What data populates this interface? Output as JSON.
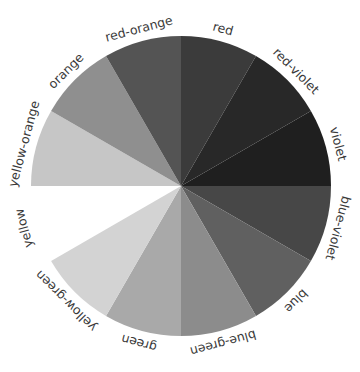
{
  "diagram": {
    "type": "color-wheel",
    "center": [
      181,
      186
    ],
    "radius": 150,
    "label_radius": 162,
    "slices": [
      {
        "name": "violet",
        "label": "violet",
        "start": -30,
        "end": 0,
        "color": "#1f1f1f",
        "present": true
      },
      {
        "name": "blue-violet",
        "label": "blue-violet",
        "start": 0,
        "end": 30,
        "color": "#474747",
        "present": true
      },
      {
        "name": "blue",
        "label": "blue",
        "start": 30,
        "end": 60,
        "color": "#606060",
        "present": true
      },
      {
        "name": "blue-green",
        "label": "blue-green",
        "start": 60,
        "end": 90,
        "color": "#8c8c8c",
        "present": true
      },
      {
        "name": "green",
        "label": "green",
        "start": 90,
        "end": 120,
        "color": "#a9a9a9",
        "present": true
      },
      {
        "name": "yellow-green",
        "label": "yellow-green",
        "start": 120,
        "end": 150,
        "color": "#d3d3d3",
        "present": true
      },
      {
        "name": "yellow",
        "label": "yellow",
        "start": 150,
        "end": 180,
        "color": "#ffffff",
        "present": false
      },
      {
        "name": "yellow-orange",
        "label": "yellow-orange",
        "start": 180,
        "end": 210,
        "color": "#c6c6c6",
        "present": true
      },
      {
        "name": "orange",
        "label": "orange",
        "start": 210,
        "end": 240,
        "color": "#8f8f8f",
        "present": true
      },
      {
        "name": "red-orange",
        "label": "red-orange",
        "start": 240,
        "end": 270,
        "color": "#545454",
        "present": true
      },
      {
        "name": "red",
        "label": "red",
        "start": 270,
        "end": 300,
        "color": "#3b3b3b",
        "present": true
      },
      {
        "name": "red-violet",
        "label": "red-violet",
        "start": 300,
        "end": 330,
        "color": "#282828",
        "present": true
      }
    ]
  }
}
